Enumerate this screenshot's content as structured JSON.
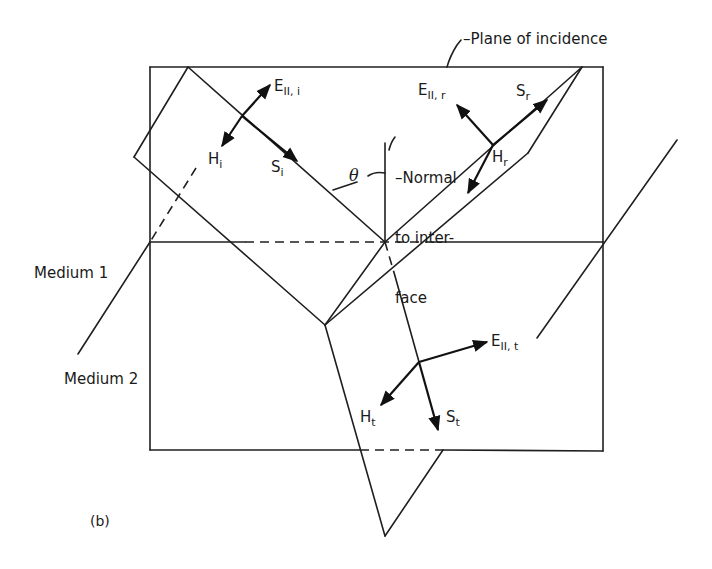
{
  "figure": {
    "panel_label": "(b)",
    "labels": {
      "plane_of_incidence": "Plane of incidence",
      "normal_line1": "Normal",
      "normal_line2": "to inter-",
      "normal_line3": "face",
      "theta": "θ",
      "medium1": "Medium 1",
      "medium2": "Medium 2"
    },
    "incident": {
      "E_main": "E",
      "E_sub": "II, i",
      "H_main": "H",
      "H_sub": "i",
      "S_main": "S",
      "S_sub": "i"
    },
    "reflected": {
      "E_main": "E",
      "E_sub": "II, r",
      "H_main": "H",
      "H_sub": "r",
      "S_main": "S",
      "S_sub": "r"
    },
    "transmitted": {
      "E_main": "E",
      "E_sub": "II, t",
      "H_main": "H",
      "H_sub": "t",
      "S_main": "S",
      "S_sub": "t"
    },
    "colors": {
      "line": "#1f1f1f",
      "background": "#ffffff"
    }
  }
}
